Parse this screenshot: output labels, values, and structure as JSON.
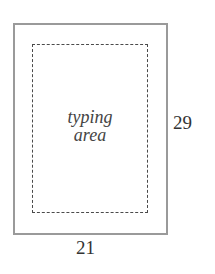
{
  "diagram": {
    "outer_page": {
      "label": "page",
      "border_color": "#9a9a9a"
    },
    "inner_area": {
      "label_line1": "typing",
      "label_line2": "area",
      "border_style": "dashed",
      "border_color": "#4a4a4a"
    },
    "dimensions": {
      "height": "29",
      "width": "21"
    }
  }
}
